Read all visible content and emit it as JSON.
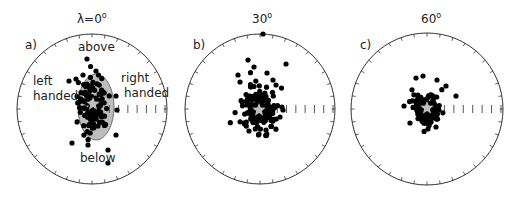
{
  "figure": {
    "panels": [
      {
        "letter": "a)",
        "title_main": "λ=0",
        "title_sup": "o",
        "center": [
          92,
          109
        ],
        "radius": 75,
        "star": [
          93,
          104
        ],
        "ellipse": {
          "cx": 96,
          "cy": 107,
          "rx": 18,
          "ry": 33,
          "fill": "#bdbdbd"
        },
        "annotations": {
          "above": "above",
          "below": "below",
          "left_line1": "left",
          "left_line2": "handed",
          "right_line1": "right",
          "right_line2": "handed"
        },
        "scatter_spread": [
          14,
          26
        ],
        "scatter_count": 110,
        "outliers": [
          [
            87,
            59
          ],
          [
            69,
            81
          ],
          [
            76,
            79
          ],
          [
            96,
            71
          ],
          [
            116,
            96
          ],
          [
            117,
            110
          ],
          [
            72,
            143
          ],
          [
            88,
            145
          ],
          [
            108,
            150
          ],
          [
            116,
            135
          ],
          [
            108,
            163
          ],
          [
            83,
            75
          ]
        ]
      },
      {
        "letter": "b)",
        "title_main": "30",
        "title_sup": "o",
        "center": [
          260,
          109
        ],
        "radius": 75,
        "star": [
          259,
          110
        ],
        "scatter_spread": [
          15,
          20
        ],
        "scatter_count": 180,
        "outliers": [
          [
            263,
            34
          ],
          [
            248,
            60
          ],
          [
            254,
            67
          ],
          [
            286,
            64
          ],
          [
            267,
            73
          ],
          [
            238,
            75
          ],
          [
            273,
            80
          ],
          [
            276,
            85
          ],
          [
            240,
            82
          ],
          [
            249,
            131
          ],
          [
            259,
            134
          ],
          [
            266,
            130
          ],
          [
            280,
            117
          ],
          [
            283,
            110
          ]
        ]
      },
      {
        "letter": "c)",
        "title_main": "60",
        "title_sup": "o",
        "center": [
          427,
          109
        ],
        "radius": 76,
        "star": [
          427,
          108
        ],
        "scatter_spread": [
          12,
          13
        ],
        "scatter_count": 170,
        "outliers": [
          [
            416,
            78
          ],
          [
            423,
            76
          ],
          [
            437,
            80
          ],
          [
            446,
            86
          ],
          [
            456,
            96
          ],
          [
            404,
            106
          ],
          [
            410,
            123
          ],
          [
            428,
            129
          ],
          [
            436,
            127
          ]
        ]
      }
    ],
    "ticks_per_circle": 36,
    "scale_ticks": 7,
    "colors": {
      "circle": "#333333",
      "dot": "#000000",
      "star": "#bfbfbf",
      "ellipse": "#bdbdbd",
      "text": "#222222"
    }
  }
}
